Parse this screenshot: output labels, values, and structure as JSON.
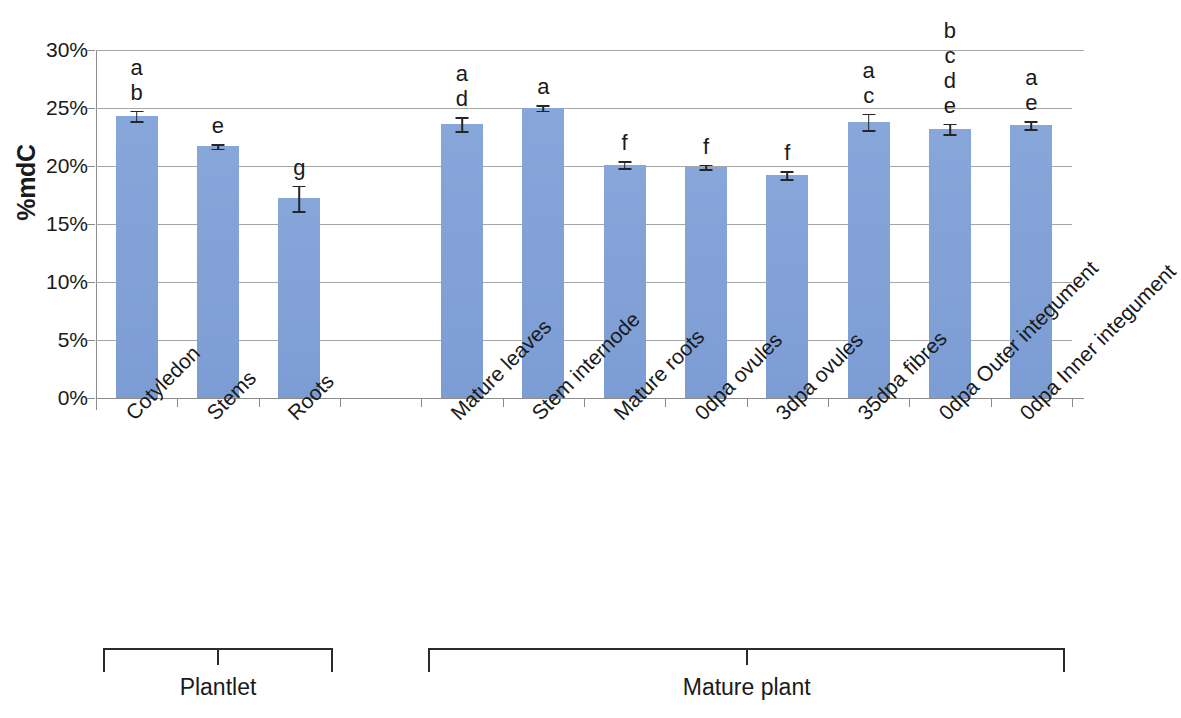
{
  "chart_data": {
    "type": "bar",
    "title": "",
    "xlabel": "",
    "ylabel": "%mdC",
    "ylim": [
      0,
      0.3
    ],
    "ytick_labels": [
      "30%",
      "25%",
      "20%",
      "15%",
      "10%",
      "5%",
      "0%"
    ],
    "ytick_values": [
      30,
      25,
      20,
      15,
      10,
      5,
      0
    ],
    "grid": true,
    "legend": null,
    "bar_color": "#7e9fd6",
    "categories": [
      "Cotyledon",
      "Stems",
      "Roots",
      "Mature leaves",
      "Stem internode",
      "Mature roots",
      "0dpa ovules",
      "3dpa ovules",
      "35dpa fibres",
      "0dpa Outer integument",
      "0dpa Inner integument"
    ],
    "values": [
      24.3,
      21.7,
      17.2,
      23.6,
      25.0,
      20.1,
      19.9,
      19.2,
      23.8,
      23.2,
      23.5
    ],
    "errors": [
      0.45,
      0.2,
      1.1,
      0.6,
      0.25,
      0.3,
      0.2,
      0.35,
      0.7,
      0.45,
      0.35
    ],
    "significance_letters": [
      "a\nb",
      "e",
      "g",
      "a\nd",
      "a",
      "f",
      "f",
      "f",
      "a\nc",
      "b\nc\nd\ne",
      "a\ne"
    ],
    "groups": [
      {
        "label": "Plantlet",
        "members": [
          "Cotyledon",
          "Stems",
          "Roots"
        ]
      },
      {
        "label": "Mature plant",
        "members": [
          "Mature leaves",
          "Stem internode",
          "Mature roots",
          "0dpa ovules",
          "3dpa ovules",
          "35dpa fibres",
          "0dpa Outer integument",
          "0dpa Inner integument"
        ]
      }
    ]
  }
}
